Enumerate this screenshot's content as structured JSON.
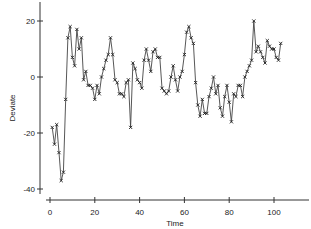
{
  "chart_data": {
    "type": "line",
    "title": "",
    "xlabel": "Time",
    "ylabel": "Deviate",
    "xlim": [
      0,
      115
    ],
    "ylim": [
      -43,
      27
    ],
    "xticks": [
      0,
      20,
      40,
      60,
      80,
      100
    ],
    "yticks": [
      -40,
      -20,
      0,
      20
    ],
    "xtick_labels": [
      "0",
      "20",
      "40",
      "60",
      "80",
      "100"
    ],
    "ytick_labels": [
      "-40",
      "-20",
      "0",
      "20"
    ],
    "grid": false,
    "legend": null,
    "marker": "x",
    "line_color": "#333333",
    "series": [
      {
        "name": "Deviate",
        "x": [
          1,
          2,
          3,
          4,
          5,
          6,
          7,
          8,
          9,
          10,
          11,
          12,
          13,
          14,
          15,
          16,
          17,
          18,
          19,
          20,
          21,
          22,
          23,
          24,
          25,
          26,
          27,
          28,
          29,
          30,
          31,
          32,
          33,
          34,
          35,
          36,
          37,
          38,
          39,
          40,
          41,
          42,
          43,
          44,
          45,
          46,
          47,
          48,
          49,
          50,
          51,
          52,
          53,
          54,
          55,
          56,
          57,
          58,
          59,
          60,
          61,
          62,
          63,
          64,
          65,
          66,
          67,
          68,
          69,
          70,
          71,
          72,
          73,
          74,
          75,
          76,
          77,
          78,
          79,
          80,
          81,
          82,
          83,
          84,
          85,
          86,
          87,
          88,
          89,
          90,
          91,
          92,
          93,
          94,
          95,
          96,
          97,
          98,
          99,
          100,
          101,
          102,
          103
        ],
        "values": [
          -18,
          -24,
          -17,
          -27,
          -37,
          -34,
          -8,
          14,
          18,
          7,
          4,
          17,
          10,
          14,
          -1,
          2,
          -3,
          -3,
          -4,
          -8,
          -3,
          -6,
          0,
          3,
          6,
          8,
          14,
          8,
          -1,
          -2,
          -6,
          -6,
          -7,
          -2,
          -1,
          -18,
          5,
          3,
          -1,
          -2,
          -4,
          6,
          10,
          6,
          2,
          9,
          10,
          7,
          7,
          -4,
          -5,
          -6,
          -5,
          0,
          4,
          -1,
          -5,
          0,
          2,
          8,
          16,
          18,
          14,
          12,
          -2,
          -10,
          -14,
          -8,
          -13,
          -13,
          -7,
          -4,
          0,
          -6,
          -3,
          -11,
          -14,
          -7,
          -3,
          -9,
          -16,
          -6,
          -7,
          -3,
          -3,
          -7,
          0,
          2,
          4,
          6,
          20,
          9,
          11,
          9,
          7,
          5,
          13,
          11,
          10,
          10,
          7,
          6,
          12
        ]
      }
    ]
  }
}
